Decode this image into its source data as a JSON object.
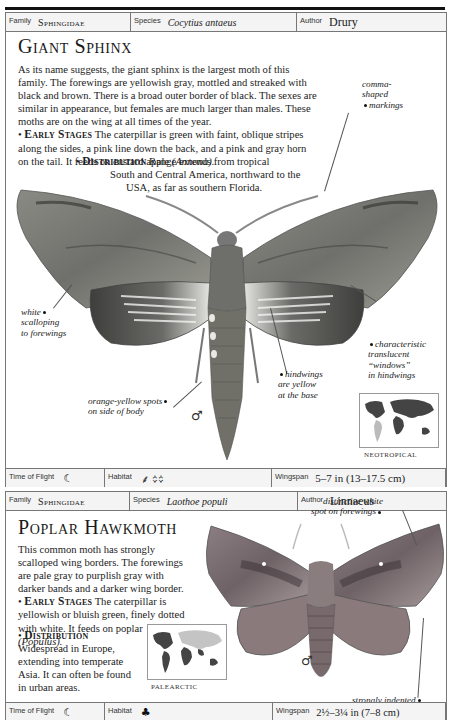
{
  "entries": [
    {
      "family_label": "Family",
      "family": "Sphingidae",
      "species_label": "Species",
      "species": "Cocytius antaeus",
      "author_label": "Author",
      "author": "Drury",
      "title": "Giant Sphinx",
      "intro": "As its name suggests, the giant sphinx is the largest moth of this family. The forewings are yellowish gray, mottled and streaked with black and brown. There is a broad outer border of black. The sexes are similar in appearance, but females are much larger than males. These moths are on the wing at all times of the year.",
      "early_stages_heading": "Early Stages",
      "early_stages": " The caterpillar is green with faint, oblique stripes along the sides, a pink line down the back, and a pink and gray horn on the tail. It feeds on custard apple ",
      "early_stages_plant": "(Annona).",
      "distribution_heading": "Distribution",
      "distribution_line1": " Range extends from tropical",
      "distribution_line2": "South and Central America, northward to the",
      "distribution_line3": "USA, as far as southern Florida.",
      "annotations": {
        "comma_markings": [
          "comma-",
          "shaped",
          "markings"
        ],
        "white_scalloping": [
          "white",
          "scalloping",
          "to forewings"
        ],
        "windows": [
          "characteristic",
          "translucent",
          "“windows”",
          "in hindwings"
        ],
        "hindwings_yellow": [
          "hindwings",
          "are yellow",
          "at the base"
        ],
        "orange_spots": [
          "orange-yellow spots",
          "on side of body"
        ]
      },
      "sex_symbol": "♂",
      "map_region": "NEOTROPICAL",
      "time_of_flight_label": "Time of Flight",
      "time_of_flight_icon": "☾",
      "habitat_label": "Habitat",
      "habitat_icons": "⸙ ᨟᨟",
      "wingspan_label": "Wingspan",
      "wingspan": "5–7 in (13–17.5 cm)"
    },
    {
      "family_label": "Family",
      "family": "Sphingidae",
      "species_label": "Species",
      "species": "Laothoe populi",
      "author_label": "Author",
      "author": "Linnaeus",
      "title": "Poplar Hawkmoth",
      "intro": "This common moth has strongly scalloped wing borders. The forewings are pale gray to purplish gray with darker bands and a darker wing border.",
      "early_stages_heading": "Early Stages",
      "early_stages": " The caterpillar is yellowish or bluish green, finely dotted with white. It feeds on poplar ",
      "early_stages_plant": "(Populus).",
      "distribution_heading": "Distribution",
      "distribution_text": "Widespread in Europe, extending into temperate Asia. It can often be found in urban areas.",
      "annotations": {
        "white_spot": [
          "distinctive white",
          "spot on forewings"
        ],
        "indented_margins": [
          "strongly indented",
          "hindwing margins"
        ]
      },
      "sex_symbol": "♂",
      "map_region": "PALEARCTIC",
      "time_of_flight_label": "Time of Flight",
      "time_of_flight_icon": "☾",
      "habitat_label": "Habitat",
      "habitat_icons": "♣",
      "wingspan_label": "Wingspan",
      "wingspan": "2½–3¼ in (7–8 cm)"
    }
  ]
}
